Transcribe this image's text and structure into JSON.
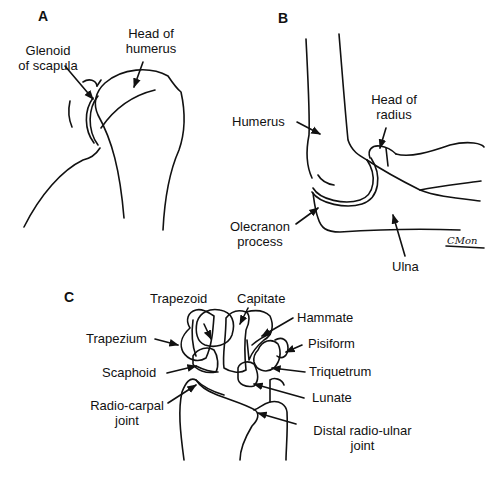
{
  "figure": {
    "panels": [
      {
        "id": "A",
        "title": "A",
        "subject": "shoulder joint",
        "labels": [
          {
            "text_lines": [
              "Glenoid",
              "of scapula"
            ]
          },
          {
            "text_lines": [
              "Head of",
              "humerus"
            ]
          }
        ]
      },
      {
        "id": "B",
        "title": "B",
        "subject": "elbow joint",
        "labels": [
          {
            "text_lines": [
              "Humerus"
            ]
          },
          {
            "text_lines": [
              "Head of",
              "radius"
            ]
          },
          {
            "text_lines": [
              "Olecranon",
              "process"
            ]
          },
          {
            "text_lines": [
              "Ulna"
            ]
          }
        ],
        "signature": "CMon"
      },
      {
        "id": "C",
        "title": "C",
        "subject": "wrist joint",
        "labels": [
          {
            "text_lines": [
              "Trapezoid"
            ]
          },
          {
            "text_lines": [
              "Capitate"
            ]
          },
          {
            "text_lines": [
              "Hammate"
            ]
          },
          {
            "text_lines": [
              "Trapezium"
            ]
          },
          {
            "text_lines": [
              "Pisiform"
            ]
          },
          {
            "text_lines": [
              "Scaphoid"
            ]
          },
          {
            "text_lines": [
              "Triquetrum"
            ]
          },
          {
            "text_lines": [
              "Lunate"
            ]
          },
          {
            "text_lines": [
              "Radio-carpal",
              "joint"
            ]
          },
          {
            "text_lines": [
              "Distal radio-ulnar",
              "joint"
            ]
          }
        ]
      }
    ]
  }
}
